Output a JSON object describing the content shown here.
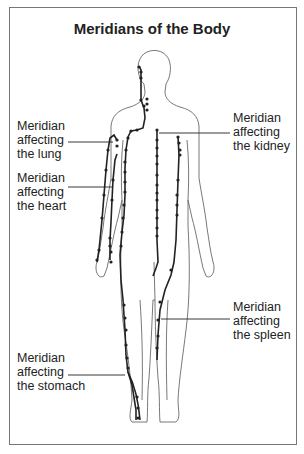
{
  "title": "Meridians of the Body",
  "labels": {
    "lung": [
      "Meridian",
      "affecting",
      "the lung"
    ],
    "heart": [
      "Meridian",
      "affecting",
      "the heart"
    ],
    "kidney": [
      "Meridian",
      "affecting",
      "the kidney"
    ],
    "spleen": [
      "Meridian",
      "affecting",
      "the spleen"
    ],
    "stomach": [
      "Meridian",
      "affecting",
      "the stomach"
    ]
  },
  "colors": {
    "border": "#777777",
    "outline": "#555555",
    "meridian": "#222222",
    "text": "#222222"
  }
}
